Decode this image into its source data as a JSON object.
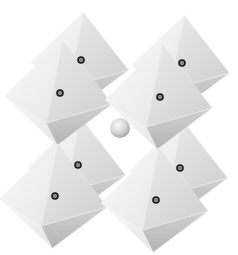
{
  "diagram": {
    "type": "crystal-structure",
    "background": "#ffffff",
    "colors": {
      "face_light": "#f4f4f4",
      "face_mid": "#dcdcdc",
      "face_dark": "#bdbdbd",
      "dot_ring": "#1a1a1a",
      "dot_center": "#8a8a8a",
      "sphere": "#cfcfcf"
    },
    "octahedra": [
      {
        "id": "back-top-left",
        "cx": 81,
        "cy": 60,
        "size": 50
      },
      {
        "id": "back-top-right",
        "cx": 182,
        "cy": 63,
        "size": 50
      },
      {
        "id": "front-top-left",
        "cx": 60,
        "cy": 93,
        "size": 55
      },
      {
        "id": "front-top-right",
        "cx": 160,
        "cy": 97,
        "size": 55
      },
      {
        "id": "back-bottom-left",
        "cx": 78,
        "cy": 165,
        "size": 50
      },
      {
        "id": "back-bottom-right",
        "cx": 180,
        "cy": 168,
        "size": 50
      },
      {
        "id": "front-bottom-left",
        "cx": 55,
        "cy": 196,
        "size": 55
      },
      {
        "id": "front-bottom-right",
        "cx": 156,
        "cy": 200,
        "size": 55
      }
    ],
    "central_sphere": {
      "cx": 120,
      "cy": 128,
      "r": 10
    }
  }
}
